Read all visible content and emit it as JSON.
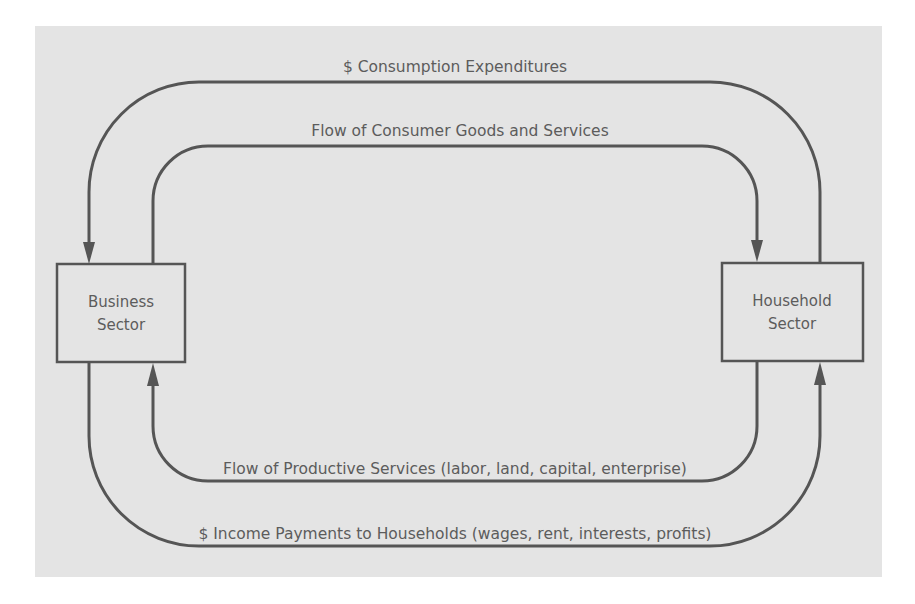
{
  "diagram": {
    "type": "circular-flow",
    "nodes": {
      "business": {
        "line1": "Business",
        "line2": "Sector"
      },
      "household": {
        "line1": "Household",
        "line2": "Sector"
      }
    },
    "flows": {
      "consumption_expenditures": {
        "label": "$ Consumption Expenditures",
        "from": "Household Sector",
        "to": "Business Sector"
      },
      "consumer_goods": {
        "label": "Flow of Consumer Goods and Services",
        "from": "Business Sector",
        "to": "Household Sector"
      },
      "productive_services": {
        "label": "Flow of Productive Services (labor, land, capital, enterprise)",
        "from": "Household Sector",
        "to": "Business Sector"
      },
      "income_payments": {
        "label": "$ Income Payments to Households (wages, rent, interests, profits)",
        "from": "Business Sector",
        "to": "Household Sector"
      }
    },
    "colors": {
      "background": "#e4e4e4",
      "line": "#555555",
      "text": "#5c5c5c"
    }
  }
}
